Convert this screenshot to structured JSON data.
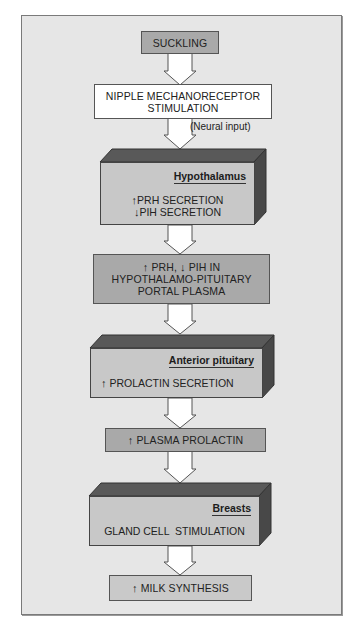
{
  "diagram": {
    "type": "flowchart",
    "colors": {
      "panel_background": "#e6e6e6",
      "box_dark": "#a9a9a9",
      "box_light": "#c9c9c9",
      "box_white": "#ffffff",
      "block_top_face": "#595959",
      "block_side_face": "#484848",
      "block_front_face": "#c8c8c8",
      "arrow_fill": "#ffffff"
    },
    "nodes": {
      "suckling": {
        "text": "SUCKLING"
      },
      "nipple": {
        "line1": "NIPPLE MECHANORECEPTOR",
        "line2": "STIMULATION"
      },
      "neural_input": {
        "text": "(Neural input)"
      },
      "hypothalamus": {
        "label": "Hypothalamus",
        "line1_arrow": "↑",
        "line1": "PRH SECRETION",
        "line2_arrow": "↓",
        "line2": "PIH SECRETION"
      },
      "portal": {
        "line1_arrow_up": "↑",
        "line1_a": "PRH,",
        "line1_arrow_down": "↓",
        "line1_b": "PIH IN",
        "line2": "HYPOTHALAMO-PITUITARY",
        "line3": "PORTAL PLASMA"
      },
      "anterior_pituitary": {
        "label": "Anterior pituitary",
        "line1_arrow": "↑",
        "line1": "PROLACTIN SECRETION"
      },
      "plasma_prolactin": {
        "arrow": "↑",
        "text": "PLASMA PROLACTIN"
      },
      "breasts": {
        "label": "Breasts",
        "line1": "GLAND CELL  STIMULATION"
      },
      "milk": {
        "arrow": "↑",
        "text": "MILK SYNTHESIS"
      }
    },
    "edges": [
      [
        "suckling",
        "nipple"
      ],
      [
        "nipple",
        "hypothalamus",
        "(Neural input)"
      ],
      [
        "hypothalamus",
        "portal"
      ],
      [
        "portal",
        "anterior_pituitary"
      ],
      [
        "anterior_pituitary",
        "plasma_prolactin"
      ],
      [
        "plasma_prolactin",
        "breasts"
      ],
      [
        "breasts",
        "milk"
      ]
    ]
  }
}
